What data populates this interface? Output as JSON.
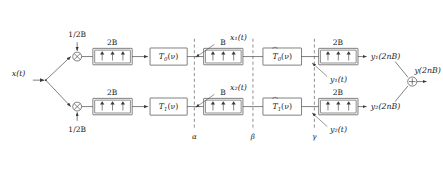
{
  "diagram": {
    "input": {
      "label": "x(t)",
      "name": "input-signal"
    },
    "carriers": [
      {
        "label": "1/2B",
        "position": "top"
      },
      {
        "label": "1/2B",
        "position": "bottom"
      }
    ],
    "branches": [
      {
        "id": "top",
        "sampler_in": {
          "rate_label": "2B",
          "arrows": 3
        },
        "analysis_filter": {
          "label": "T0(ν)",
          "base": "T",
          "sub": "0",
          "arg": "(ν)",
          "tilde": false
        },
        "mid_signal": "x₁(t)",
        "sampler_mid": {
          "rate_label": "B",
          "arrows": 3
        },
        "synthesis_filter": {
          "label": "T̃ 0(ν)",
          "base": "T",
          "sub": "0",
          "arg": "(ν)",
          "tilde": true
        },
        "pre_out_signal": "y₁(t)",
        "sampler_out": {
          "rate_label": "2B",
          "arrows": 3
        },
        "output": "y₁(2nB)"
      },
      {
        "id": "bottom",
        "sampler_in": {
          "rate_label": "2B",
          "arrows": 3
        },
        "analysis_filter": {
          "label": "T1(ν)",
          "base": "T",
          "sub": "1",
          "arg": "(ν)",
          "tilde": false
        },
        "mid_signal": "x₂(t)",
        "sampler_mid": {
          "rate_label": "B",
          "arrows": 3
        },
        "synthesis_filter": {
          "label": "T̃ 1(ν)",
          "base": "T",
          "sub": "1",
          "arg": "(ν)",
          "tilde": true
        },
        "pre_out_signal": "y₂(t)",
        "sampler_out": {
          "rate_label": "2B",
          "arrows": 3
        },
        "output": "y₂(2nB)"
      }
    ],
    "summer": {
      "symbol": "+",
      "name": "summing-junction"
    },
    "output": {
      "label": "y(2nB)",
      "name": "output-signal"
    },
    "section_markers": [
      {
        "label": "α",
        "x": 193
      },
      {
        "label": "β",
        "x": 250
      },
      {
        "label": "γ",
        "x": 312
      }
    ],
    "glyphs": {
      "multiplier": "⊗",
      "adder": "⊕",
      "sampler_arrow": "↑",
      "nu": "ν"
    },
    "colors": {
      "line": "#3a3a3a",
      "dashed": "#555555",
      "text": "#1b1b1b",
      "background": "#ffffff"
    }
  }
}
